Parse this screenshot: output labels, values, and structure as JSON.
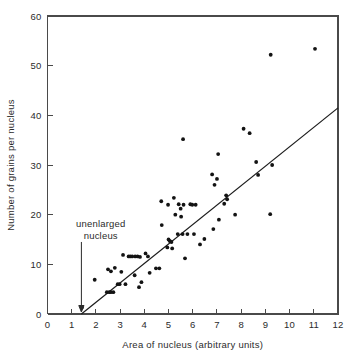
{
  "figure": {
    "background_color": "#ffffff",
    "point_color": "#131313",
    "line_color": "#1c1c1c",
    "axis_color": "#4a4a4a"
  },
  "chart_data": {
    "type": "scatter",
    "title": "",
    "xlabel": "Area of nucleus (arbitrary units)",
    "ylabel": "Number of grains per nucleus",
    "xlim": [
      0,
      12
    ],
    "ylim": [
      0,
      60
    ],
    "xticks": [
      0,
      1,
      2,
      3,
      4,
      5,
      6,
      7,
      8,
      9,
      10,
      11,
      12
    ],
    "xtick_labels": [
      "0",
      "1",
      "2",
      "3",
      "4",
      "5",
      "6",
      "7",
      "8",
      "9",
      "10",
      "11",
      "12"
    ],
    "yticks": [
      0,
      10,
      20,
      30,
      40,
      50,
      60
    ],
    "ytick_labels": [
      "0",
      "10",
      "20",
      "30",
      "40",
      "50",
      "60"
    ],
    "grid": false,
    "legend": null,
    "annotations": [
      {
        "text_lines": [
          "unenlarged",
          "nucleus"
        ],
        "text_x": 2.2,
        "text_y": 17.5,
        "arrow_x": 1.4,
        "arrow_from_y": 14.5,
        "arrow_to_y": 0.4
      }
    ],
    "fit_line": {
      "name": "regression line",
      "x_start": 1.4,
      "y_start": 0,
      "x_end": 12.0,
      "y_end": 41.5
    },
    "points": [
      [
        1.42,
        1.3
      ],
      [
        1.95,
        6.9
      ],
      [
        2.45,
        4.4
      ],
      [
        2.55,
        4.4
      ],
      [
        2.62,
        4.4
      ],
      [
        2.72,
        4.4
      ],
      [
        2.5,
        9.0
      ],
      [
        2.62,
        8.6
      ],
      [
        2.78,
        9.3
      ],
      [
        2.9,
        6.0
      ],
      [
        2.98,
        6.0
      ],
      [
        3.05,
        8.5
      ],
      [
        3.12,
        11.9
      ],
      [
        3.22,
        6.0
      ],
      [
        3.35,
        11.6
      ],
      [
        3.42,
        11.6
      ],
      [
        3.5,
        11.6
      ],
      [
        3.6,
        7.8
      ],
      [
        3.62,
        11.6
      ],
      [
        3.72,
        11.6
      ],
      [
        3.78,
        5.4
      ],
      [
        3.82,
        11.5
      ],
      [
        3.88,
        6.4
      ],
      [
        4.05,
        12.2
      ],
      [
        4.15,
        11.6
      ],
      [
        4.22,
        8.3
      ],
      [
        4.48,
        9.2
      ],
      [
        4.62,
        9.2
      ],
      [
        4.7,
        22.7
      ],
      [
        4.72,
        17.9
      ],
      [
        4.95,
        13.4
      ],
      [
        4.98,
        22.0
      ],
      [
        5.0,
        15.0
      ],
      [
        5.05,
        14.7
      ],
      [
        5.12,
        14.5
      ],
      [
        5.15,
        13.2
      ],
      [
        5.22,
        23.4
      ],
      [
        5.28,
        20.0
      ],
      [
        5.38,
        16.1
      ],
      [
        5.42,
        22.1
      ],
      [
        5.5,
        21.2
      ],
      [
        5.52,
        19.6
      ],
      [
        5.58,
        16.1
      ],
      [
        5.6,
        35.2
      ],
      [
        5.62,
        22.0
      ],
      [
        5.68,
        11.2
      ],
      [
        5.78,
        16.1
      ],
      [
        5.9,
        22.1
      ],
      [
        5.98,
        22.0
      ],
      [
        6.05,
        16.1
      ],
      [
        6.12,
        22.0
      ],
      [
        6.3,
        14.0
      ],
      [
        6.48,
        15.1
      ],
      [
        6.8,
        28.1
      ],
      [
        6.85,
        17.1
      ],
      [
        6.9,
        26.0
      ],
      [
        7.0,
        27.2
      ],
      [
        7.05,
        32.2
      ],
      [
        7.08,
        19.0
      ],
      [
        7.3,
        22.2
      ],
      [
        7.38,
        23.9
      ],
      [
        7.42,
        23.1
      ],
      [
        7.75,
        20.0
      ],
      [
        8.1,
        37.3
      ],
      [
        8.35,
        36.4
      ],
      [
        8.62,
        30.6
      ],
      [
        8.7,
        28.0
      ],
      [
        9.2,
        20.1
      ],
      [
        9.22,
        52.2
      ],
      [
        9.28,
        30.0
      ],
      [
        11.05,
        53.4
      ]
    ]
  }
}
